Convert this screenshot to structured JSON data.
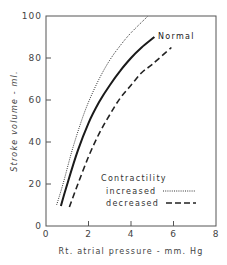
{
  "chart_data": {
    "type": "line",
    "title": "",
    "xlabel": "Rt. atrial pressure - mm. Hg",
    "ylabel": "Stroke volume - ml.",
    "xlim": [
      0,
      8
    ],
    "ylim": [
      0,
      100
    ],
    "x_ticks": [
      "0",
      "2",
      "4",
      "6",
      "8"
    ],
    "y_ticks": [
      "0",
      "20",
      "40",
      "60",
      "80",
      "100"
    ],
    "grid": false,
    "legend": {
      "title": "Contractility",
      "entries": [
        {
          "label": "increased",
          "style": "dotted"
        },
        {
          "label": "decreased",
          "style": "dashed"
        }
      ],
      "position": "lower right inside plot"
    },
    "series": [
      {
        "name": "Normal",
        "style": "solid",
        "annotation": "Normal",
        "x": [
          0.7,
          1.0,
          1.5,
          2.0,
          2.5,
          3.0,
          3.5,
          4.0,
          4.5,
          5.1
        ],
        "y": [
          9.5,
          20,
          36,
          49,
          59,
          67,
          74,
          80,
          85,
          90
        ]
      },
      {
        "name": "Contractility increased",
        "style": "dotted",
        "x": [
          0.5,
          0.8,
          1.2,
          1.6,
          2.0,
          2.5,
          3.0,
          3.5,
          4.0,
          4.8
        ],
        "y": [
          10,
          20,
          35,
          48,
          59,
          70,
          79,
          86,
          92,
          100
        ]
      },
      {
        "name": "Contractility decreased",
        "style": "dashed",
        "x": [
          1.1,
          1.5,
          2.0,
          2.5,
          3.0,
          3.5,
          4.0,
          4.5,
          5.0,
          5.9
        ],
        "y": [
          9,
          20,
          33,
          44,
          53,
          61,
          67,
          73,
          77,
          85
        ]
      }
    ]
  }
}
